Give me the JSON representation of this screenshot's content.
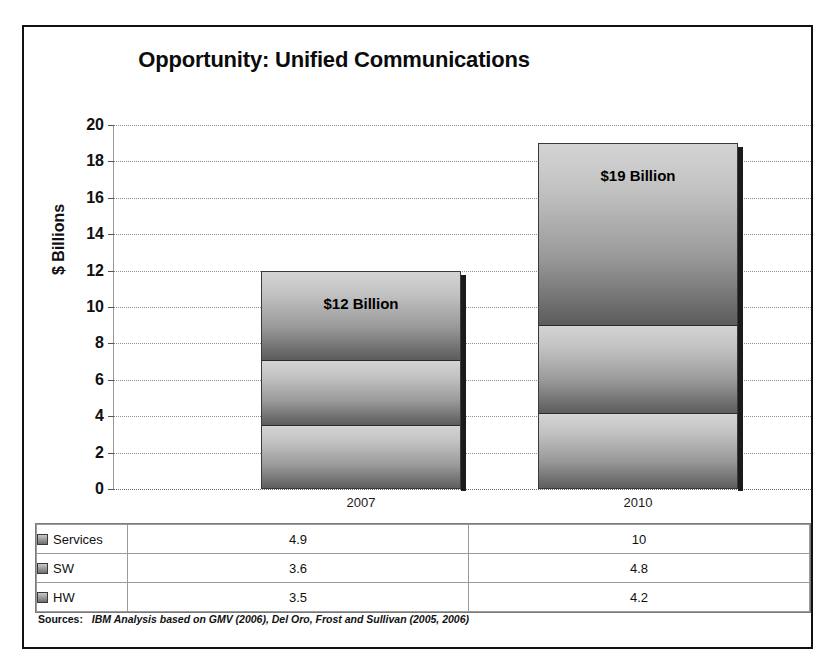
{
  "chart_data": {
    "type": "bar",
    "subtype": "stacked-column",
    "title": "Opportunity: Unified Communications",
    "title_lead": "Opportunity:",
    "title_rest": "Unified Communications",
    "xlabel": "",
    "ylabel": "$ Billions",
    "ylim": [
      0,
      20
    ],
    "ytick_step": 2,
    "yticks": [
      "20",
      "18",
      "16",
      "14",
      "12",
      "10",
      "8",
      "6",
      "4",
      "2",
      "0"
    ],
    "ytick_values": [
      20,
      18,
      16,
      14,
      12,
      10,
      8,
      6,
      4,
      2,
      0
    ],
    "grid": true,
    "legend_position": "data-table",
    "categories": [
      "2007",
      "2010"
    ],
    "series": [
      {
        "name": "Services",
        "values": [
          4.9,
          10
        ],
        "display_values": [
          "4.9",
          "10"
        ]
      },
      {
        "name": "SW",
        "values": [
          3.6,
          4.8
        ],
        "display_values": [
          "3.6",
          "4.8"
        ]
      },
      {
        "name": "HW",
        "values": [
          3.5,
          4.2
        ],
        "display_values": [
          "3.5",
          "4.2"
        ]
      }
    ],
    "stack_order_bottom_to_top": [
      "HW",
      "SW",
      "Services"
    ],
    "totals": [
      12.0,
      19.0
    ],
    "annotations": [
      {
        "category": "2007",
        "text": "$12 Billion"
      },
      {
        "category": "2010",
        "text": "$19 Billion"
      }
    ],
    "colors": {
      "bar_light": "#d4d4d4",
      "bar_dark": "#5c5c5c",
      "segment_border": "#2b2b2b",
      "shadow": "#1b1b1b",
      "gridline": "#8d8d8d",
      "frame": "#111111",
      "text": "#101010"
    }
  },
  "data_table": {
    "row_labels": [
      "Services",
      "SW",
      "HW"
    ],
    "columns": [
      "2007",
      "2010"
    ],
    "rows": [
      {
        "label": "Services",
        "values": [
          "4.9",
          "10"
        ]
      },
      {
        "label": "SW",
        "values": [
          "3.6",
          "4.8"
        ]
      },
      {
        "label": "HW",
        "values": [
          "3.5",
          "4.2"
        ]
      }
    ]
  },
  "sources": {
    "label": "Sources:",
    "text": "IBM Analysis based on GMV (2006), Del Oro, Frost and Sullivan (2005, 2006)"
  }
}
